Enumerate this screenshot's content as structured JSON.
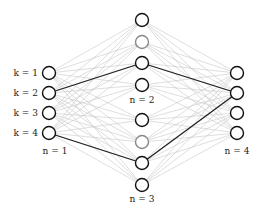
{
  "diagram": {
    "type": "layered-graph",
    "columns": [
      {
        "id": "n1",
        "label": "n = 1",
        "label_pos": [
          55,
          154
        ],
        "x": 49,
        "nodes": [
          {
            "y": 73,
            "label": "k = 1",
            "stroke": "#111111"
          },
          {
            "y": 93,
            "label": "k = 2",
            "stroke": "#111111"
          },
          {
            "y": 113,
            "label": "k = 3",
            "stroke": "#111111"
          },
          {
            "y": 133,
            "label": "k = 4",
            "stroke": "#111111"
          }
        ]
      },
      {
        "id": "n2",
        "label": "n = 2",
        "label_pos": [
          142,
          103
        ],
        "x": 142,
        "nodes": [
          {
            "y": 20,
            "stroke": "#111111"
          },
          {
            "y": 42,
            "stroke": "#888888"
          },
          {
            "y": 63,
            "stroke": "#111111"
          },
          {
            "y": 85,
            "stroke": "#111111"
          }
        ]
      },
      {
        "id": "n3",
        "label": "n = 3",
        "label_pos": [
          142,
          202
        ],
        "x": 142,
        "nodes": [
          {
            "y": 120,
            "stroke": "#111111"
          },
          {
            "y": 142,
            "stroke": "#888888"
          },
          {
            "y": 163,
            "stroke": "#111111"
          },
          {
            "y": 185,
            "stroke": "#111111"
          }
        ]
      },
      {
        "id": "n4",
        "label": "n = 4",
        "label_pos": [
          237,
          154
        ],
        "x": 237,
        "nodes": [
          {
            "y": 73,
            "stroke": "#111111"
          },
          {
            "y": 93,
            "stroke": "#111111"
          },
          {
            "y": 113,
            "stroke": "#111111"
          },
          {
            "y": 133,
            "stroke": "#111111"
          }
        ]
      }
    ],
    "highlighted_path": [
      {
        "from": [
          49,
          93
        ],
        "to": [
          142,
          63
        ]
      },
      {
        "from": [
          49,
          133
        ],
        "to": [
          142,
          163
        ]
      },
      {
        "from": [
          142,
          63
        ],
        "to": [
          237,
          93
        ]
      },
      {
        "from": [
          142,
          163
        ],
        "to": [
          237,
          93
        ]
      }
    ],
    "colors": {
      "edge": "#c8c8c8",
      "highlight": "#222222",
      "node_fill": "#ffffff"
    },
    "node_radius": 6.5
  }
}
